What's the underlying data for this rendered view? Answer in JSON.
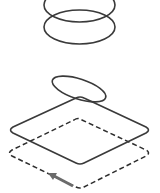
{
  "diagram": {
    "colors": {
      "stroke": "#3a3a3a",
      "dashed": "#2e2e2e",
      "arrow": "#6b6b6b",
      "background": "#ffffff"
    },
    "elements": [
      {
        "id": "top-ring",
        "type": "ellipse",
        "cx": 79.5,
        "cy": 5,
        "rx": 35.5,
        "ry": 17
      },
      {
        "id": "second-ring",
        "type": "ellipse",
        "cx": 79.5,
        "cy": 27,
        "rx": 35.5,
        "ry": 17
      },
      {
        "id": "tilted-ring",
        "type": "ellipse",
        "cx": 79,
        "cy": 89,
        "rx": 28,
        "ry": 10,
        "rotate": 18
      },
      {
        "id": "solid-diamond",
        "type": "rounded-rhombus",
        "points": [
          [
            80,
            96
          ],
          [
            150,
            130
          ],
          [
            80,
            165
          ],
          [
            9,
            130
          ]
        ]
      },
      {
        "id": "dashed-diamond",
        "type": "dashed-rhombus",
        "points": [
          [
            78,
            118
          ],
          [
            150,
            152
          ],
          [
            80,
            189
          ],
          [
            8,
            153
          ]
        ]
      },
      {
        "id": "direction-arrow",
        "type": "arrow",
        "from": [
          73,
          186
        ],
        "to": [
          49,
          173
        ]
      }
    ]
  }
}
